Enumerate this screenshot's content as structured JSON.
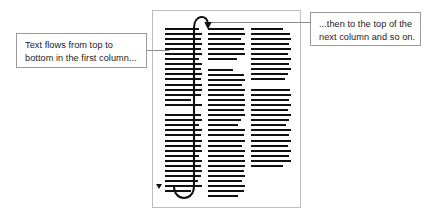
{
  "diagram": {
    "background_color": "#ffffff",
    "page": {
      "name": "document-page",
      "border_color": "#bdbdbd",
      "fill_color": "#ffffff"
    }
  },
  "callouts": [
    {
      "id": "left",
      "name": "callout-text-flows",
      "line1": "Text flows from top to",
      "line2": "bottom in the first column...",
      "border_color": "#9a9a9a",
      "text_color": "#1a1a1a"
    },
    {
      "id": "right",
      "name": "callout-next-column",
      "line1": "...then to the top of the",
      "line2": "next column and so on.",
      "border_color": "#9a9a9a",
      "text_color": "#1a1a1a"
    }
  ],
  "columns": [
    {
      "id": "column-1",
      "label": "first-column",
      "line_color": "#111111",
      "line_widths": [
        92,
        100,
        97,
        100,
        96,
        100,
        92,
        100,
        97,
        100,
        96,
        100,
        100,
        96,
        70,
        100,
        0,
        96,
        100,
        92,
        100,
        97,
        100,
        96,
        100,
        92,
        100,
        97,
        100,
        96,
        88,
        100,
        70
      ]
    },
    {
      "id": "column-2",
      "label": "second-column",
      "line_widths": [
        96,
        100,
        88,
        100,
        96,
        100,
        78,
        0,
        68,
        96,
        100,
        92,
        100,
        96,
        100,
        100,
        96,
        100,
        90,
        82,
        100,
        96,
        100,
        92,
        100,
        96,
        100,
        100,
        96,
        100,
        92,
        100,
        96,
        82
      ]
    },
    {
      "id": "column-3",
      "label": "third-column",
      "line_widths": [
        80,
        98,
        100,
        96,
        100,
        92,
        100,
        96,
        100,
        92,
        84,
        0,
        98,
        100,
        96,
        100,
        92,
        100,
        96,
        88,
        100,
        96,
        100,
        92,
        100,
        96,
        100,
        80
      ]
    }
  ],
  "flow_arrow": {
    "name": "column-flow-arrow",
    "color": "#111111",
    "description": "curve from bottom of first column up to top of second column",
    "arrowhead": "down-triangle"
  },
  "end_marker": {
    "name": "text-flow-end-marker",
    "color": "#111111",
    "shape": "down-triangle"
  },
  "leaders": {
    "left_name": "leader-line-left",
    "right_name": "leader-line-right",
    "color": "#8e8e8e"
  }
}
